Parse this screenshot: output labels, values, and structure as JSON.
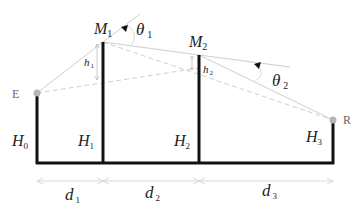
{
  "diagram": {
    "nodes": {
      "E": {
        "label": "E"
      },
      "R": {
        "label": "R"
      },
      "M1": {
        "main": "M",
        "sub": "1"
      },
      "M2": {
        "main": "M",
        "sub": "2"
      }
    },
    "heights": [
      {
        "main": "H",
        "sub": "0"
      },
      {
        "main": "H",
        "sub": "1"
      },
      {
        "main": "H",
        "sub": "2"
      },
      {
        "main": "H",
        "sub": "3"
      }
    ],
    "offsets": [
      {
        "main": "h",
        "sub": "1"
      },
      {
        "main": "h",
        "sub": "2"
      }
    ],
    "angles": [
      {
        "main": "θ",
        "sub": "1"
      },
      {
        "main": "θ",
        "sub": "2"
      }
    ],
    "distances": [
      {
        "main": "d",
        "sub": "1"
      },
      {
        "main": "d",
        "sub": "2"
      },
      {
        "main": "d",
        "sub": "3"
      }
    ],
    "colors": {
      "pole": "#111111",
      "ray": "#c8c8c8",
      "dashed": "#c8c8c8",
      "endpoint": "#b0b0b0",
      "text": "#222222"
    }
  }
}
